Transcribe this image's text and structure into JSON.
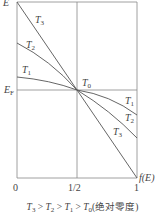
{
  "axes": {
    "y_label": "E",
    "x_label": "f(E)",
    "fermi_label_main": "E",
    "fermi_label_sub": "F",
    "x_ticks": [
      "0",
      "1/2",
      "1"
    ]
  },
  "curves": [
    {
      "name": "T3",
      "main": "T",
      "sub": "3"
    },
    {
      "name": "T2",
      "main": "T",
      "sub": "2"
    },
    {
      "name": "T1",
      "main": "T",
      "sub": "1"
    },
    {
      "name": "T0",
      "main": "T",
      "sub": "0"
    }
  ],
  "caption": {
    "t3": "T",
    "s3": "3",
    "t2": "T",
    "s2": "2",
    "t1": "T",
    "s1": "1",
    "t0": "T",
    "s0": "0",
    "gt": " > ",
    "note": "(绝对零度)"
  },
  "colors": {
    "line": "#555555",
    "frame": "#888888"
  }
}
